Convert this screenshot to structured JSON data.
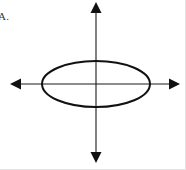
{
  "figure": {
    "label": "A.",
    "background_color": "#ffffff",
    "border_color": "#e2e2e2",
    "width": 186,
    "height": 170
  },
  "chart_data": {
    "type": "line",
    "title": "",
    "subtitle": "",
    "xlabel": "",
    "ylabel": "",
    "annotations": [
      "A."
    ],
    "legend": [],
    "legend_position": "none",
    "grid": false,
    "axis_style": "double-headed-arrow-cross",
    "axis_color": "#1a1a1a",
    "axis_line_width": 1,
    "xlim": [
      -86,
      84
    ],
    "ylim": [
      -79,
      82
    ],
    "xticks": [],
    "yticks": [],
    "xticklabels": [],
    "yticklabels": [],
    "origin_px": {
      "x": 96,
      "y": 84
    },
    "x_axis": {
      "name": "horizontal-axis",
      "y_px": 84,
      "x_start_px": 10,
      "x_end_px": 180,
      "arrow_start": true,
      "arrow_end": true
    },
    "y_axis": {
      "name": "vertical-axis",
      "x_px": 96,
      "y_start_px": 2,
      "y_end_px": 163,
      "arrow_start": true,
      "arrow_end": true
    },
    "series": [
      {
        "name": "ellipse",
        "shape": "ellipse",
        "center": [
          0,
          0
        ],
        "center_px": [
          96,
          84
        ],
        "semi_major_axis_a": 54,
        "semi_minor_axis_b": 23,
        "orientation": "horizontal",
        "equation": "x^2/54^2 + y^2/23^2 = 1",
        "stroke_color": "#111111",
        "stroke_width": 2,
        "fill": "none",
        "vertices_px": [
          [
            42,
            84
          ],
          [
            150,
            84
          ]
        ],
        "co_vertices_px": [
          [
            96,
            61
          ],
          [
            96,
            107
          ]
        ]
      }
    ]
  }
}
